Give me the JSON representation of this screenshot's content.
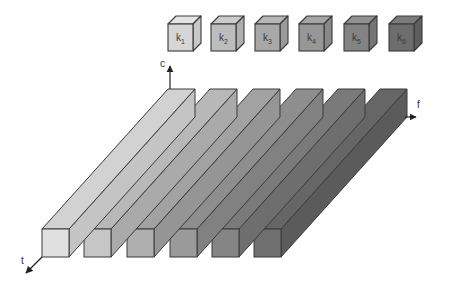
{
  "diagram": {
    "type": "3d tensor convolution schematic",
    "axes": [
      {
        "name": "c",
        "label": "c",
        "direction": "up"
      },
      {
        "name": "f",
        "label": "f",
        "direction": "right"
      },
      {
        "name": "t",
        "label": "t",
        "direction": "down-left"
      }
    ],
    "kernels": [
      {
        "label": "k",
        "sub": "1",
        "color": "#d6d6d6"
      },
      {
        "label": "k",
        "sub": "2",
        "color": "#bdbdbd"
      },
      {
        "label": "k",
        "sub": "3",
        "color": "#a8a8a8"
      },
      {
        "label": "k",
        "sub": "4",
        "color": "#979797"
      },
      {
        "label": "k",
        "sub": "5",
        "color": "#838383"
      },
      {
        "label": "k",
        "sub": "6",
        "color": "#6d6d6d"
      }
    ],
    "bars": [
      {
        "index": 1,
        "front": "#e0e0e0",
        "top": "#d2d2d2",
        "side": "#c4c4c4"
      },
      {
        "index": 2,
        "front": "#c6c6c6",
        "top": "#b8b8b8",
        "side": "#aaaaaa"
      },
      {
        "index": 3,
        "front": "#aeaeae",
        "top": "#a2a2a2",
        "side": "#959595"
      },
      {
        "index": 4,
        "front": "#9a9a9a",
        "top": "#8e8e8e",
        "side": "#818181"
      },
      {
        "index": 5,
        "front": "#858585",
        "top": "#7a7a7a",
        "side": "#6e6e6e"
      },
      {
        "index": 6,
        "front": "#6f6f6f",
        "top": "#666666",
        "side": "#5b5b5b"
      }
    ],
    "stroke": "#3a3a3a"
  }
}
